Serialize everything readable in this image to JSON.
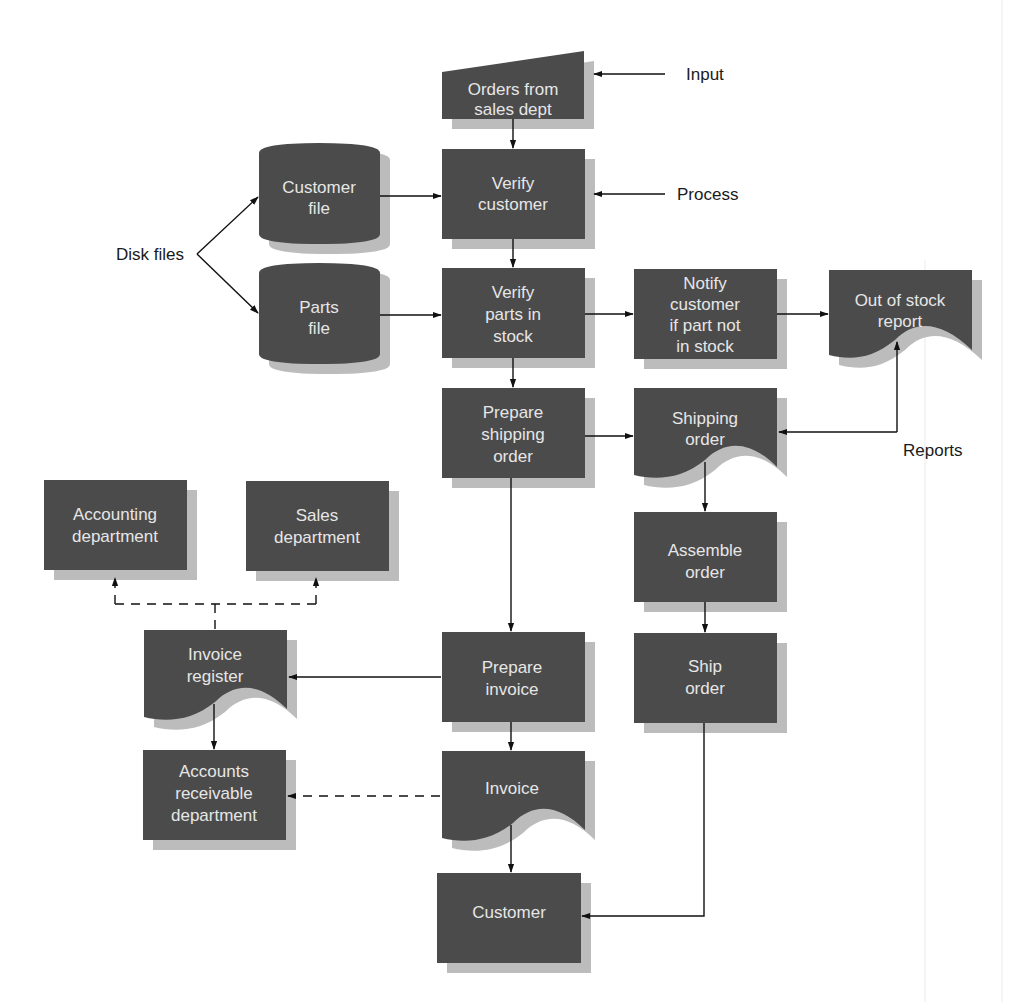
{
  "diagram": {
    "type": "system flowchart",
    "colors": {
      "shape_fill": "#4b4b4b",
      "shape_shadow": "#bcbcbc",
      "shape_text": "#e6e6e6",
      "line": "#111111",
      "background": "#ffffff"
    },
    "annotations": {
      "input": "Input",
      "process": "Process",
      "disk_files": "Disk files",
      "reports": "Reports"
    },
    "nodes": {
      "orders_from_sales": {
        "shape": "manual-input",
        "lines": [
          "Orders from",
          "sales dept"
        ]
      },
      "verify_customer": {
        "shape": "process",
        "lines": [
          "Verify",
          "customer"
        ]
      },
      "customer_file": {
        "shape": "disk",
        "lines": [
          "Customer",
          "file"
        ]
      },
      "parts_file": {
        "shape": "disk",
        "lines": [
          "Parts",
          "file"
        ]
      },
      "verify_parts": {
        "shape": "process",
        "lines": [
          "Verify",
          "parts in",
          "stock"
        ]
      },
      "notify_customer": {
        "shape": "process",
        "lines": [
          "Notify",
          "customer",
          "if part not",
          "in stock"
        ]
      },
      "out_of_stock_report": {
        "shape": "document",
        "lines": [
          "Out of stock",
          "report"
        ]
      },
      "prepare_shipping": {
        "shape": "process",
        "lines": [
          "Prepare",
          "shipping",
          "order"
        ]
      },
      "shipping_order": {
        "shape": "document",
        "lines": [
          "Shipping",
          "order"
        ]
      },
      "assemble_order": {
        "shape": "process",
        "lines": [
          "Assemble",
          "order"
        ]
      },
      "ship_order": {
        "shape": "process",
        "lines": [
          "Ship",
          "order"
        ]
      },
      "accounting_dept": {
        "shape": "process",
        "lines": [
          "Accounting",
          "department"
        ]
      },
      "sales_dept": {
        "shape": "process",
        "lines": [
          "Sales",
          "department"
        ]
      },
      "invoice_register": {
        "shape": "document",
        "lines": [
          "Invoice",
          "register"
        ]
      },
      "prepare_invoice": {
        "shape": "process",
        "lines": [
          "Prepare",
          "invoice"
        ]
      },
      "accounts_receivable": {
        "shape": "process",
        "lines": [
          "Accounts",
          "receivable",
          "department"
        ]
      },
      "invoice": {
        "shape": "document",
        "lines": [
          "Invoice"
        ]
      },
      "customer": {
        "shape": "process",
        "lines": [
          "Customer"
        ]
      }
    },
    "edges": [
      {
        "from": "orders_from_sales",
        "to": "verify_customer",
        "style": "solid"
      },
      {
        "from": "customer_file",
        "to": "verify_customer",
        "style": "solid"
      },
      {
        "from": "verify_customer",
        "to": "verify_parts",
        "style": "solid"
      },
      {
        "from": "parts_file",
        "to": "verify_parts",
        "style": "solid"
      },
      {
        "from": "verify_parts",
        "to": "notify_customer",
        "style": "solid"
      },
      {
        "from": "notify_customer",
        "to": "out_of_stock_report",
        "style": "solid"
      },
      {
        "from": "verify_parts",
        "to": "prepare_shipping",
        "style": "solid"
      },
      {
        "from": "prepare_shipping",
        "to": "shipping_order",
        "style": "solid"
      },
      {
        "from": "shipping_order",
        "to": "assemble_order",
        "style": "solid"
      },
      {
        "from": "assemble_order",
        "to": "ship_order",
        "style": "solid"
      },
      {
        "from": "ship_order",
        "to": "customer",
        "style": "solid"
      },
      {
        "from": "prepare_shipping",
        "to": "prepare_invoice",
        "style": "solid"
      },
      {
        "from": "prepare_invoice",
        "to": "invoice_register",
        "style": "solid"
      },
      {
        "from": "prepare_invoice",
        "to": "invoice",
        "style": "solid"
      },
      {
        "from": "invoice",
        "to": "customer",
        "style": "solid"
      },
      {
        "from": "invoice",
        "to": "accounts_receivable",
        "style": "dashed"
      },
      {
        "from": "invoice_register",
        "to": "accounts_receivable",
        "style": "solid"
      },
      {
        "from": "invoice_register",
        "to": "accounting_dept",
        "style": "dashed"
      },
      {
        "from": "invoice_register",
        "to": "sales_dept",
        "style": "dashed"
      }
    ]
  }
}
